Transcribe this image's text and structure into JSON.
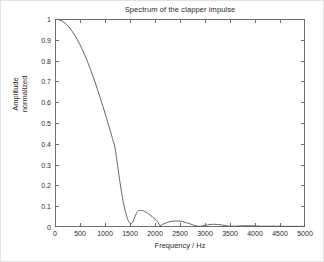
{
  "chart_data": {
    "type": "line",
    "title": "Spectrum of the clapper impulse",
    "xlabel": "Frequency / Hz",
    "ylabel": "Amplitude\nnormalized",
    "ylabel_lines": [
      "Amplitude",
      "normalized"
    ],
    "xlim": [
      0,
      5000
    ],
    "ylim": [
      0,
      1
    ],
    "grid": false,
    "legend": null,
    "line_color": "#555555",
    "xticks": [
      0,
      500,
      1000,
      1500,
      2000,
      2500,
      3000,
      3500,
      4000,
      4500,
      5000
    ],
    "xticklabels": [
      "0",
      "500",
      "1000",
      "1500",
      "2000",
      "2500",
      "3000",
      "3500",
      "4000",
      "4500",
      "5000"
    ],
    "yticks": [
      0,
      0.1,
      0.2,
      0.3,
      0.4,
      0.5,
      0.6,
      0.7,
      0.8,
      0.9,
      1
    ],
    "yticklabels": [
      "0",
      "0.1",
      "0.2",
      "0.3",
      "0.4",
      "0.5",
      "0.6",
      "0.7",
      "0.8",
      "0.9",
      "1"
    ],
    "series": [
      {
        "name": "normalized amplitude spectrum",
        "x": [
          0,
          50,
          100,
          150,
          200,
          250,
          300,
          350,
          400,
          450,
          500,
          550,
          600,
          650,
          700,
          750,
          800,
          850,
          900,
          950,
          1000,
          1050,
          1100,
          1150,
          1200,
          1225,
          1250,
          1300,
          1350,
          1400,
          1450,
          1500,
          1550,
          1600,
          1650,
          1700,
          1750,
          1800,
          1850,
          1900,
          1950,
          2000,
          2050,
          2080,
          2100,
          2150,
          2200,
          2250,
          2300,
          2350,
          2400,
          2450,
          2500,
          2550,
          2600,
          2650,
          2700,
          2750,
          2800,
          2850,
          2900,
          2950,
          3000,
          3050,
          3100,
          3150,
          3200,
          3250,
          3300,
          3350,
          3400,
          3450,
          3500,
          3600,
          3700,
          3800,
          3900,
          4000,
          4100,
          4200,
          4300,
          4400,
          4500,
          4600,
          4700,
          4800,
          4900,
          5000
        ],
        "y": [
          1.0,
          0.999,
          0.995,
          0.989,
          0.98,
          0.969,
          0.955,
          0.939,
          0.92,
          0.899,
          0.876,
          0.851,
          0.824,
          0.795,
          0.764,
          0.731,
          0.697,
          0.661,
          0.624,
          0.586,
          0.547,
          0.507,
          0.466,
          0.425,
          0.383,
          0.34,
          0.297,
          0.214,
          0.14,
          0.082,
          0.04,
          0.017,
          0.021,
          0.05,
          0.075,
          0.08,
          0.079,
          0.074,
          0.067,
          0.058,
          0.048,
          0.038,
          0.026,
          0.014,
          0.006,
          0.012,
          0.018,
          0.022,
          0.026,
          0.028,
          0.029,
          0.029,
          0.028,
          0.026,
          0.022,
          0.019,
          0.015,
          0.011,
          0.007,
          0.004,
          0.003,
          0.005,
          0.008,
          0.01,
          0.012,
          0.013,
          0.013,
          0.012,
          0.011,
          0.009,
          0.007,
          0.005,
          0.004,
          0.004,
          0.005,
          0.006,
          0.006,
          0.005,
          0.004,
          0.004,
          0.004,
          0.004,
          0.004,
          0.003,
          0.003,
          0.003,
          0.003,
          0.003
        ]
      }
    ],
    "annotations": {
      "main_lobe_peak": {
        "x": 0,
        "y": 1.0
      },
      "first_null": {
        "x": 1225,
        "y": 0.017
      },
      "first_sidelobe_peak": {
        "x": 1700,
        "y": 0.08
      },
      "second_null": {
        "x": 2090,
        "y": 0.006
      },
      "second_sidelobe_peak": {
        "x": 2420,
        "y": 0.029
      },
      "third_null": {
        "x": 2880,
        "y": 0.003
      },
      "third_sidelobe_peak": {
        "x": 3200,
        "y": 0.013
      }
    }
  },
  "figure": {
    "background_color": "#ffffff",
    "axis_color": "#6e6e6e",
    "text_color": "#2b2b2b"
  }
}
